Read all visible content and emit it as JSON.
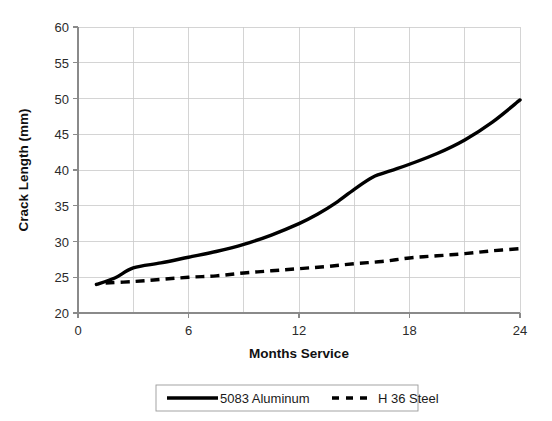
{
  "chart_data": {
    "type": "line",
    "title": "",
    "xlabel": "Months Service",
    "ylabel": "Crack Length (mm)",
    "xlim": [
      0,
      24
    ],
    "ylim": [
      20,
      60
    ],
    "xticks": [
      "0",
      "6",
      "12",
      "18",
      "24"
    ],
    "xtick_values": [
      0,
      6,
      12,
      18,
      24
    ],
    "yticks": [
      "20",
      "25",
      "30",
      "35",
      "40",
      "45",
      "50",
      "55",
      "60"
    ],
    "ytick_values": [
      20,
      25,
      30,
      35,
      40,
      45,
      50,
      55,
      60
    ],
    "grid": true,
    "grid_x_step": 3,
    "grid_y_step": 5,
    "legend_position": "bottom",
    "series": [
      {
        "name": "5083 Aluminum",
        "style": "solid",
        "color": "#000000",
        "x": [
          1.0,
          2.0,
          3.0,
          4.5,
          6.0,
          7.5,
          9.0,
          10.5,
          12.0,
          13.0,
          14.0,
          15.0,
          16.0,
          17.0,
          18.0,
          19.5,
          21.0,
          22.5,
          24.0
        ],
        "values": [
          24.0,
          24.9,
          26.3,
          27.0,
          27.8,
          28.6,
          29.6,
          30.9,
          32.5,
          33.8,
          35.4,
          37.3,
          39.0,
          39.9,
          40.8,
          42.3,
          44.2,
          46.7,
          49.8
        ]
      },
      {
        "name": "H 36 Steel",
        "style": "dashed",
        "color": "#000000",
        "x": [
          1.5,
          3.0,
          4.5,
          6.0,
          7.5,
          9.0,
          10.5,
          12.0,
          13.5,
          15.0,
          16.5,
          18.0,
          19.5,
          21.0,
          22.5,
          24.0
        ],
        "values": [
          24.2,
          24.4,
          24.7,
          25.0,
          25.2,
          25.6,
          25.9,
          26.2,
          26.5,
          26.9,
          27.2,
          27.7,
          28.0,
          28.3,
          28.7,
          29.0
        ]
      }
    ]
  },
  "legend": {
    "items": [
      {
        "label": "5083 Aluminum",
        "style": "solid"
      },
      {
        "label": "H 36 Steel",
        "style": "dashed"
      }
    ]
  },
  "axes": {
    "x_title": "Months Service",
    "y_title": "Crack Length (mm)"
  },
  "colors": {
    "series": "#000000",
    "grid": "#c9c9c9",
    "axis": "#8a8a8a",
    "background": "#ffffff"
  }
}
